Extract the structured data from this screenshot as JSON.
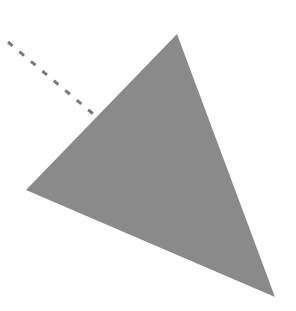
{
  "diagram": {
    "width": 296,
    "height": 311,
    "background": "#ffffff",
    "triangle": {
      "points": [
        [
          177,
          34
        ],
        [
          26,
          190
        ],
        [
          275,
          297
        ]
      ],
      "fill": "#8a8a8a"
    },
    "dashed_line": {
      "x1": 8,
      "y1": 42,
      "x2": 98,
      "y2": 118,
      "stroke": "#7a7a7a",
      "stroke_width": 3,
      "dash": "6,9"
    }
  }
}
